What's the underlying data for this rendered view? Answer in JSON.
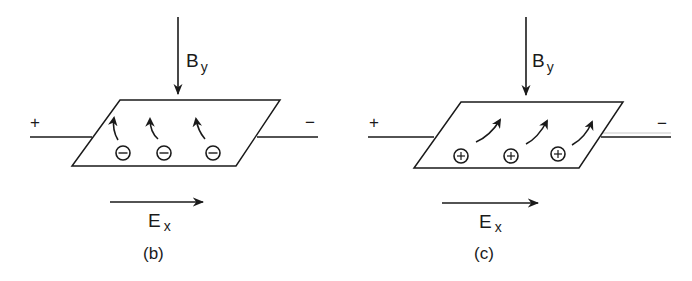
{
  "figure": {
    "panels": [
      {
        "id": "b",
        "caption": "(b)",
        "field_B": {
          "symbol": "B",
          "subscript": "y",
          "direction": "down"
        },
        "field_E": {
          "symbol": "E",
          "subscript": "x",
          "direction": "right"
        },
        "left_terminal": "+",
        "right_terminal": "−",
        "carriers": {
          "type": "electron",
          "sign_glyph": "−",
          "count": 3,
          "motion": "deflected up-left"
        }
      },
      {
        "id": "c",
        "caption": "(c)",
        "field_B": {
          "symbol": "B",
          "subscript": "y",
          "direction": "down"
        },
        "field_E": {
          "symbol": "E",
          "subscript": "x",
          "direction": "right"
        },
        "left_terminal": "+",
        "right_terminal": "−",
        "carriers": {
          "type": "hole",
          "sign_glyph": "+",
          "count": 3,
          "motion": "deflected up-right"
        }
      }
    ],
    "colors": {
      "ink": "#1a1a1a",
      "background": "#ffffff"
    }
  }
}
